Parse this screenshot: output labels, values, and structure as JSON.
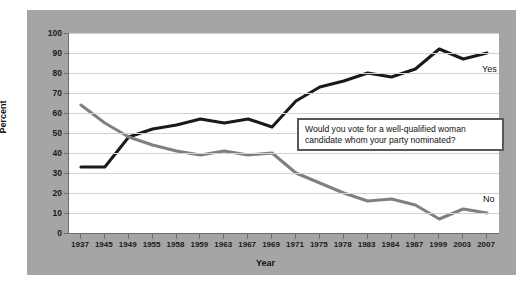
{
  "chart_data": {
    "type": "line",
    "title": "",
    "xlabel": "Year",
    "ylabel": "Percent",
    "ylim": [
      0,
      100
    ],
    "ytick_step": 10,
    "yticks": [
      100,
      90,
      80,
      70,
      60,
      50,
      40,
      30,
      20,
      10,
      0
    ],
    "grid": true,
    "legend_position": "inline-right-end-labels",
    "categories": [
      "1937",
      "1945",
      "1949",
      "1955",
      "1958",
      "1959",
      "1963",
      "1967",
      "1969",
      "1971",
      "1975",
      "1978",
      "1983",
      "1984",
      "1987",
      "1999",
      "2003",
      "2007"
    ],
    "series": [
      {
        "name": "Yes",
        "color": "#1a1a1a",
        "values": [
          33,
          33,
          48,
          52,
          54,
          57,
          55,
          57,
          53,
          66,
          73,
          76,
          80,
          78,
          82,
          92,
          87,
          90
        ]
      },
      {
        "name": "No",
        "color": "#808080",
        "values": [
          64,
          55,
          48,
          44,
          41,
          39,
          41,
          39,
          40,
          30,
          25,
          20,
          16,
          17,
          14,
          7,
          12,
          10
        ]
      }
    ],
    "annotations": [
      {
        "id": "question-box",
        "text": "Would you vote for a well-qualified woman candidate whom your party nominated?"
      }
    ]
  },
  "axes": {
    "y_title": "Percent",
    "x_title": "Year"
  },
  "annotation": {
    "line1": "Would you vote for a well-qualified woman",
    "line2": "candidate whom your party nominated?"
  },
  "labels": {
    "yes": "Yes",
    "no": "No"
  },
  "colors": {
    "panel_background": "#a5a5a5",
    "plot_background": "#ffffff",
    "grid": "#d2d2d2",
    "axis": "#6e6e6e",
    "yes_line": "#1a1a1a",
    "no_line": "#808080",
    "text": "#111111"
  }
}
